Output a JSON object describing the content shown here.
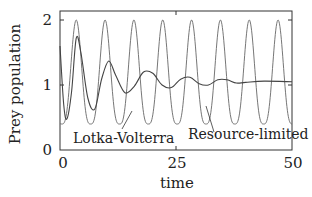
{
  "chart_data": {
    "type": "line",
    "title": "",
    "xlabel": "time",
    "ylabel": "Prey population",
    "xlim": [
      0,
      50
    ],
    "ylim": [
      0,
      2.15
    ],
    "xticks": [
      0,
      25,
      50
    ],
    "yticks": [
      0,
      1,
      2
    ],
    "xtick_labels": [
      "0",
      "25",
      "50"
    ],
    "ytick_labels": [
      "0",
      "1",
      "2"
    ],
    "grid": false,
    "legend": "none (inline annotations)",
    "series": [
      {
        "name": "Lotka-Volterra",
        "style": "thin gray",
        "color": "#555555",
        "description": "undamped periodic oscillation, period ~6.25, peaks ~2.0, troughs ~0.4",
        "peaks_t": [
          3.5,
          9.6,
          15.9,
          22.1,
          28.3,
          34.6,
          40.8,
          47.0
        ],
        "peak_value": 2.0,
        "trough_value": 0.4
      },
      {
        "name": "Resource-limited",
        "style": "thin gray",
        "color": "#444444",
        "description": "damped oscillation converging to ~1.05",
        "points": [
          [
            0,
            1.6
          ],
          [
            0.8,
            0.7
          ],
          [
            1.5,
            0.48
          ],
          [
            2.5,
            0.9
          ],
          [
            3.5,
            1.72
          ],
          [
            4.5,
            1.5
          ],
          [
            6,
            0.8
          ],
          [
            7.5,
            0.63
          ],
          [
            9,
            1.1
          ],
          [
            10.5,
            1.37
          ],
          [
            12,
            1.15
          ],
          [
            14,
            0.88
          ],
          [
            16,
            0.98
          ],
          [
            18,
            1.2
          ],
          [
            20,
            1.18
          ],
          [
            22,
            1.0
          ],
          [
            24,
            0.96
          ],
          [
            26,
            1.09
          ],
          [
            28,
            1.12
          ],
          [
            30,
            1.02
          ],
          [
            32,
            1.0
          ],
          [
            34,
            1.08
          ],
          [
            36,
            1.08
          ],
          [
            38,
            1.03
          ],
          [
            40,
            1.04
          ],
          [
            44,
            1.06
          ],
          [
            50,
            1.05
          ]
        ]
      }
    ],
    "annotations": [
      {
        "text": "Lotka-Volterra",
        "x_pos": 20,
        "y_pos": 0.12
      },
      {
        "text": "Resource-limited",
        "x_pos": 40,
        "y_pos": 0.18
      }
    ]
  }
}
